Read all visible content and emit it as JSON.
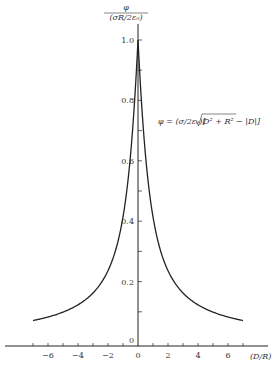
{
  "chart_data": {
    "type": "line",
    "title": "",
    "ylabel": "φ / (σR/2ε₀)",
    "ylabel_num": "φ",
    "ylabel_den": "(σR/2ε₀)",
    "xlabel": "(D/R)",
    "annotation": "φ = (σ/2ε₀)[√(D² + R²) − |D|]",
    "annotation_prefix": "φ = (σ/2ε₀)[",
    "annotation_sqrt": "D² + R²",
    "annotation_suffix": " − |D|]",
    "xlim": [
      -7,
      7
    ],
    "ylim": [
      0,
      1.0
    ],
    "grid": false,
    "legend": null,
    "x_ticks": [
      -6,
      -4,
      -2,
      0,
      2,
      4,
      6
    ],
    "x_tick_labels": [
      "−6",
      "−4",
      "−2",
      "0",
      "2",
      "4",
      "6"
    ],
    "y_ticks": [
      0,
      0.2,
      0.4,
      0.6,
      0.8,
      1.0
    ],
    "y_tick_labels": [
      "0",
      "0.2",
      "0.4",
      "0.6",
      "0.8",
      "1.0"
    ],
    "series": [
      {
        "name": "φ",
        "x": [
          -7,
          -6,
          -5,
          -4,
          -3,
          -2,
          -1.5,
          -1,
          -0.5,
          -0.25,
          0,
          0.25,
          0.5,
          1,
          1.5,
          2,
          3,
          4,
          5,
          6,
          7
        ],
        "values": [
          0.071,
          0.083,
          0.099,
          0.123,
          0.162,
          0.236,
          0.303,
          0.414,
          0.618,
          0.781,
          1.0,
          0.781,
          0.618,
          0.414,
          0.303,
          0.236,
          0.162,
          0.123,
          0.099,
          0.083,
          0.071
        ]
      }
    ]
  }
}
